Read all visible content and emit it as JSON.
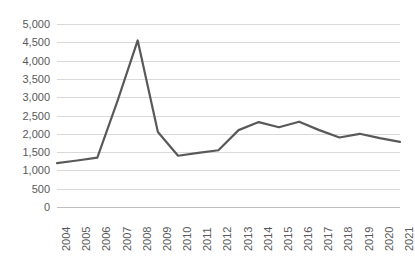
{
  "chart_data": {
    "type": "line",
    "title": "",
    "subtitle": "",
    "xlabel": "",
    "ylabel": "",
    "legend": [],
    "legend_position": "none",
    "grid": true,
    "grid_axis": "y",
    "line_color": "#595959",
    "gridline_color": "#d9d9d9",
    "label_color": "#595959",
    "background_color": "#ffffff",
    "ylim": [
      0,
      5000
    ],
    "y_ticks": [
      0,
      500,
      1000,
      1500,
      2000,
      2500,
      3000,
      3500,
      4000,
      4500,
      5000
    ],
    "y_tick_labels": [
      "0",
      "500",
      "1,000",
      "1,500",
      "2,000",
      "2,500",
      "3,000",
      "3,500",
      "4,000",
      "4,500",
      "5,000"
    ],
    "categories": [
      "2004",
      "2005",
      "2006",
      "2007",
      "2008",
      "2009",
      "2010",
      "2011",
      "2012",
      "2013",
      "2014",
      "2015",
      "2016",
      "2017",
      "2018",
      "2019",
      "2020",
      "2021"
    ],
    "values": [
      1200,
      1270,
      1350,
      2900,
      4550,
      2050,
      1400,
      1480,
      1550,
      2100,
      2320,
      2180,
      2330,
      2100,
      1900,
      2000,
      1880,
      1780
    ],
    "series": [
      {
        "name": "series-1",
        "values": [
          1200,
          1270,
          1350,
          2900,
          4550,
          2050,
          1400,
          1480,
          1550,
          2100,
          2320,
          2180,
          2330,
          2100,
          1900,
          2000,
          1880,
          1780
        ]
      }
    ]
  }
}
